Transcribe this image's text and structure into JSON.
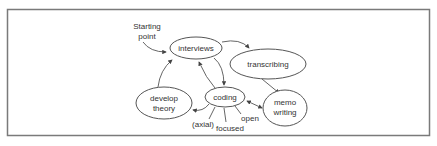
{
  "diagram": {
    "start_label": {
      "line1": "Starting",
      "line2": "point"
    },
    "nodes": {
      "interviews": "interviews",
      "transcribing": "transcribing",
      "develop_theory": {
        "line1": "develop",
        "line2": "theory"
      },
      "coding": "coding",
      "memo_writing": {
        "line1": "memo",
        "line2": "writing"
      }
    },
    "coding_types": {
      "axial": "(axial)",
      "focused": "focused",
      "open": "open"
    },
    "edges": [
      {
        "from": "Starting point",
        "to": "interviews"
      },
      {
        "from": "interviews",
        "to": "transcribing"
      },
      {
        "from": "interviews",
        "to": "coding"
      },
      {
        "from": "coding",
        "to": "interviews"
      },
      {
        "from": "transcribing",
        "to": "memo writing"
      },
      {
        "from": "coding",
        "to": "memo writing",
        "bidirectional": true
      },
      {
        "from": "coding",
        "to": "develop theory"
      },
      {
        "from": "develop theory",
        "to": "interviews"
      }
    ],
    "colors": {
      "stroke": "#555555",
      "frame": "#7a7a7a",
      "text": "#333333"
    }
  }
}
